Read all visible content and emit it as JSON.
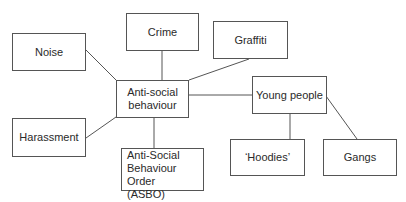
{
  "diagram": {
    "type": "mind-map",
    "center": {
      "id": "asb",
      "label": "Anti-social behaviour"
    },
    "nodes": [
      {
        "id": "noise",
        "label": "Noise",
        "x": 12,
        "y": 33,
        "w": 74,
        "h": 38
      },
      {
        "id": "crime",
        "label": "Crime",
        "x": 126,
        "y": 13,
        "w": 73,
        "h": 38
      },
      {
        "id": "graffiti",
        "label": "Graffiti",
        "x": 213,
        "y": 21,
        "w": 75,
        "h": 38
      },
      {
        "id": "asb",
        "label": "Anti-social behaviour",
        "x": 116,
        "y": 80,
        "w": 73,
        "h": 38
      },
      {
        "id": "young",
        "label": "Young people",
        "x": 252,
        "y": 76,
        "w": 75,
        "h": 38
      },
      {
        "id": "harassment",
        "label": "Harassment",
        "x": 12,
        "y": 118,
        "w": 74,
        "h": 39
      },
      {
        "id": "asbo",
        "label": "Anti-Social Behaviour Order (ASBO)",
        "x": 121,
        "y": 148,
        "w": 83,
        "h": 43
      },
      {
        "id": "hoodies",
        "label": "‘Hoodies’",
        "x": 230,
        "y": 139,
        "w": 75,
        "h": 37
      },
      {
        "id": "gangs",
        "label": "Gangs",
        "x": 323,
        "y": 139,
        "w": 74,
        "h": 37
      }
    ],
    "edges": [
      {
        "from": "asb",
        "to": "noise"
      },
      {
        "from": "asb",
        "to": "crime"
      },
      {
        "from": "asb",
        "to": "graffiti"
      },
      {
        "from": "asb",
        "to": "young"
      },
      {
        "from": "asb",
        "to": "harassment"
      },
      {
        "from": "asb",
        "to": "asbo"
      },
      {
        "from": "young",
        "to": "hoodies"
      },
      {
        "from": "young",
        "to": "gangs"
      }
    ]
  },
  "labels": {
    "noise": "Noise",
    "crime": "Crime",
    "graffiti": "Graffiti",
    "asb_line1": "Anti-social",
    "asb_line2": "behaviour",
    "young": "Young people",
    "harassment": "Harassment",
    "asbo_line1": "Anti-Social",
    "asbo_line2": "Behaviour Order",
    "asbo_line3": "(ASBO)",
    "hoodies": "‘Hoodies’",
    "gangs": "Gangs"
  }
}
